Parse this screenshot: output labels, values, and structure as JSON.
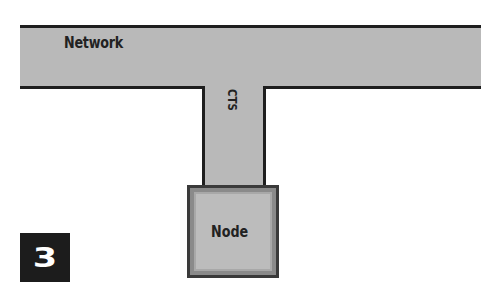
{
  "diagram": {
    "figure_number": "3",
    "network": {
      "label": "Network"
    },
    "connection": {
      "label": "CTS"
    },
    "node": {
      "label": "Node"
    }
  },
  "colors": {
    "fill": "#b9b9b9",
    "border": "#1e1e1e",
    "badge": "#1c1c1c"
  }
}
